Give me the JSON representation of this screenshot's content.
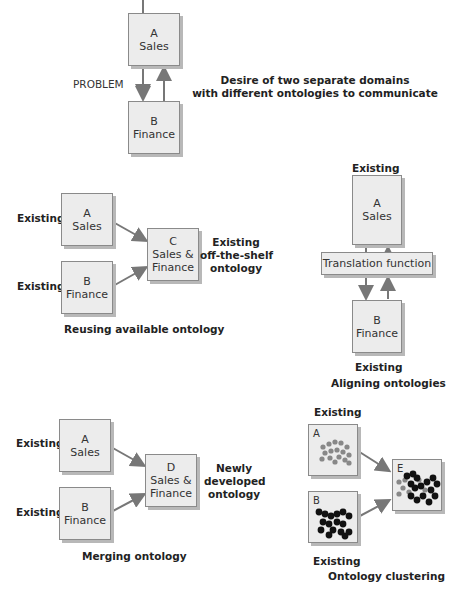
{
  "problem": {
    "label": "PROBLEM",
    "box_a": {
      "letter": "A",
      "name": "Sales"
    },
    "box_b": {
      "letter": "B",
      "name": "Finance"
    },
    "description_line1": "Desire of two separate domains",
    "description_line2": "with different ontologies to communicate"
  },
  "reusing": {
    "existing_a": "Existing",
    "existing_b": "Existing",
    "box_a": {
      "letter": "A",
      "name": "Sales"
    },
    "box_b": {
      "letter": "B",
      "name": "Finance"
    },
    "box_c": {
      "letter": "C",
      "name_line1": "Sales &",
      "name_line2": "Finance"
    },
    "note_line1": "Existing",
    "note_line2": "off-the-shelf",
    "note_line3": "ontology",
    "title": "Reusing available ontology"
  },
  "aligning": {
    "existing_top": "Existing",
    "box_a": {
      "letter": "A",
      "name": "Sales"
    },
    "translation": "Translation function",
    "box_b": {
      "letter": "B",
      "name": "Finance"
    },
    "existing_bottom": "Existing",
    "title": "Aligning ontologies"
  },
  "merging": {
    "existing_a": "Existing",
    "existing_b": "Existing",
    "box_a": {
      "letter": "A",
      "name": "Sales"
    },
    "box_b": {
      "letter": "B",
      "name": "Finance"
    },
    "box_d": {
      "letter": "D",
      "name_line1": "Sales &",
      "name_line2": "Finance"
    },
    "note_line1": "Newly",
    "note_line2": "developed",
    "note_line3": "ontology",
    "title": "Merging ontology"
  },
  "clustering": {
    "existing_top": "Existing",
    "box_a_letter": "A",
    "box_b_letter": "B",
    "box_e_letter": "E",
    "existing_bottom": "Existing",
    "title": "Ontology clustering"
  },
  "colors": {
    "box_fill": "#ececec",
    "box_border": "#8a8a8a",
    "arrow": "#777777",
    "cluster_gray": "#888888",
    "cluster_black": "#111111"
  }
}
